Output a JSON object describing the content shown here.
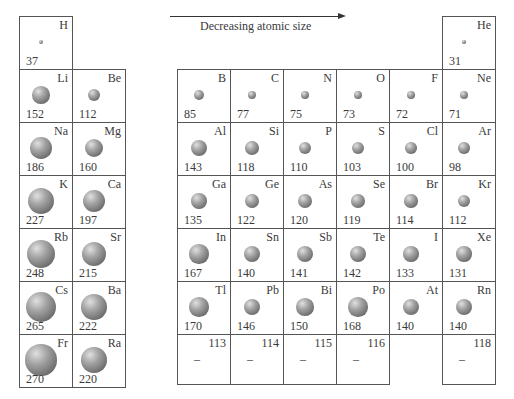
{
  "arrow": {
    "label": "Decreasing atomic size",
    "direction": "right"
  },
  "cell_size": 53,
  "elements": [
    {
      "symbol": "H",
      "radius": "37",
      "col": 0,
      "row": 0
    },
    {
      "symbol": "He",
      "radius": "31",
      "col": 7,
      "row": 0
    },
    {
      "symbol": "Li",
      "radius": "152",
      "col": 0,
      "row": 1
    },
    {
      "symbol": "Be",
      "radius": "112",
      "col": 1,
      "row": 1
    },
    {
      "symbol": "B",
      "radius": "85",
      "col": 2,
      "row": 1
    },
    {
      "symbol": "C",
      "radius": "77",
      "col": 3,
      "row": 1
    },
    {
      "symbol": "N",
      "radius": "75",
      "col": 4,
      "row": 1
    },
    {
      "symbol": "O",
      "radius": "73",
      "col": 5,
      "row": 1
    },
    {
      "symbol": "F",
      "radius": "72",
      "col": 6,
      "row": 1
    },
    {
      "symbol": "Ne",
      "radius": "71",
      "col": 7,
      "row": 1
    },
    {
      "symbol": "Na",
      "radius": "186",
      "col": 0,
      "row": 2
    },
    {
      "symbol": "Mg",
      "radius": "160",
      "col": 1,
      "row": 2
    },
    {
      "symbol": "Al",
      "radius": "143",
      "col": 2,
      "row": 2
    },
    {
      "symbol": "Si",
      "radius": "118",
      "col": 3,
      "row": 2
    },
    {
      "symbol": "P",
      "radius": "110",
      "col": 4,
      "row": 2
    },
    {
      "symbol": "S",
      "radius": "103",
      "col": 5,
      "row": 2
    },
    {
      "symbol": "Cl",
      "radius": "100",
      "col": 6,
      "row": 2
    },
    {
      "symbol": "Ar",
      "radius": "98",
      "col": 7,
      "row": 2
    },
    {
      "symbol": "K",
      "radius": "227",
      "col": 0,
      "row": 3
    },
    {
      "symbol": "Ca",
      "radius": "197",
      "col": 1,
      "row": 3
    },
    {
      "symbol": "Ga",
      "radius": "135",
      "col": 2,
      "row": 3
    },
    {
      "symbol": "Ge",
      "radius": "122",
      "col": 3,
      "row": 3
    },
    {
      "symbol": "As",
      "radius": "120",
      "col": 4,
      "row": 3
    },
    {
      "symbol": "Se",
      "radius": "119",
      "col": 5,
      "row": 3
    },
    {
      "symbol": "Br",
      "radius": "114",
      "col": 6,
      "row": 3
    },
    {
      "symbol": "Kr",
      "radius": "112",
      "col": 7,
      "row": 3
    },
    {
      "symbol": "Rb",
      "radius": "248",
      "col": 0,
      "row": 4
    },
    {
      "symbol": "Sr",
      "radius": "215",
      "col": 1,
      "row": 4
    },
    {
      "symbol": "In",
      "radius": "167",
      "col": 2,
      "row": 4
    },
    {
      "symbol": "Sn",
      "radius": "140",
      "col": 3,
      "row": 4
    },
    {
      "symbol": "Sb",
      "radius": "141",
      "col": 4,
      "row": 4
    },
    {
      "symbol": "Te",
      "radius": "142",
      "col": 5,
      "row": 4
    },
    {
      "symbol": "I",
      "radius": "133",
      "col": 6,
      "row": 4
    },
    {
      "symbol": "Xe",
      "radius": "131",
      "col": 7,
      "row": 4
    },
    {
      "symbol": "Cs",
      "radius": "265",
      "col": 0,
      "row": 5
    },
    {
      "symbol": "Ba",
      "radius": "222",
      "col": 1,
      "row": 5
    },
    {
      "symbol": "Tl",
      "radius": "170",
      "col": 2,
      "row": 5
    },
    {
      "symbol": "Pb",
      "radius": "146",
      "col": 3,
      "row": 5
    },
    {
      "symbol": "Bi",
      "radius": "150",
      "col": 4,
      "row": 5
    },
    {
      "symbol": "Po",
      "radius": "168",
      "col": 5,
      "row": 5
    },
    {
      "symbol": "At",
      "radius": "140",
      "col": 6,
      "row": 5
    },
    {
      "symbol": "Rn",
      "radius": "140",
      "col": 7,
      "row": 5
    },
    {
      "symbol": "Fr",
      "radius": "270",
      "col": 0,
      "row": 6
    },
    {
      "symbol": "Ra",
      "radius": "220",
      "col": 1,
      "row": 6
    },
    {
      "symbol": "113",
      "radius": "–",
      "col": 2,
      "row": 6,
      "unknown": true
    },
    {
      "symbol": "114",
      "radius": "–",
      "col": 3,
      "row": 6,
      "unknown": true
    },
    {
      "symbol": "115",
      "radius": "–",
      "col": 4,
      "row": 6,
      "unknown": true
    },
    {
      "symbol": "116",
      "radius": "–",
      "col": 5,
      "row": 6,
      "unknown": true
    },
    {
      "symbol": "118",
      "radius": "–",
      "col": 7,
      "row": 6,
      "unknown": true
    }
  ]
}
